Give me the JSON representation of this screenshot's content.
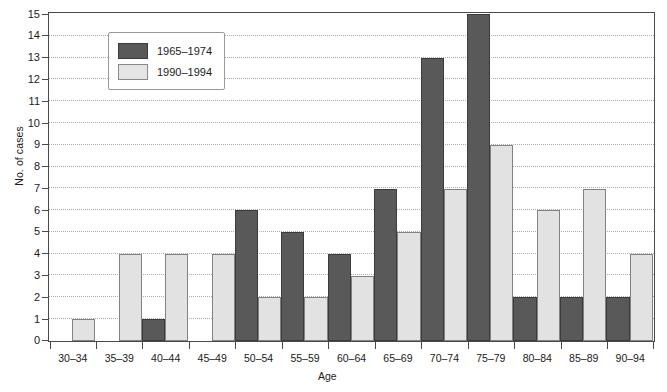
{
  "chart_data": {
    "type": "bar",
    "title": "",
    "xlabel": "Age",
    "ylabel": "No. of cases",
    "categories": [
      "30–34",
      "35–39",
      "40–44",
      "45–49",
      "50–54",
      "55–59",
      "60–64",
      "65–69",
      "70–74",
      "75–79",
      "80–84",
      "85–89",
      "90–94"
    ],
    "series": [
      {
        "name": "1965–1974",
        "color": "#595959",
        "values": [
          0,
          0,
          1,
          0,
          6,
          5,
          4,
          7,
          13,
          15,
          2,
          2,
          2
        ]
      },
      {
        "name": "1990–1994",
        "color": "#e2e2e2",
        "values": [
          1,
          4,
          4,
          4,
          2,
          2,
          3,
          5,
          7,
          9,
          6,
          7,
          4
        ]
      }
    ],
    "ylim": [
      0,
      15
    ],
    "yticks": [
      0,
      1,
      2,
      3,
      4,
      5,
      6,
      7,
      8,
      9,
      10,
      11,
      12,
      13,
      14,
      15
    ],
    "ytick_labels": [
      "0",
      "1",
      "2",
      "3",
      "4",
      "5",
      "6",
      "7",
      "8",
      "9",
      "10",
      "11",
      "12",
      "13",
      "14",
      "15"
    ],
    "grid": true,
    "grid_axis": "y",
    "legend_position": "upper-left-inset"
  },
  "legend": {
    "entries": [
      {
        "label": "1965–1974"
      },
      {
        "label": "1990–1994"
      }
    ]
  },
  "axes": {
    "ylabel": "No. of cases",
    "xlabel": "Age"
  }
}
